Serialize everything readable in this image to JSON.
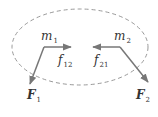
{
  "diagram": {
    "boundary": {
      "style": "dashed ellipse",
      "color": "#999999"
    },
    "bodies": [
      {
        "id": "m1",
        "label": "m",
        "sub": "1"
      },
      {
        "id": "m2",
        "label": "m",
        "sub": "2"
      }
    ],
    "internal_forces": [
      {
        "label": "f",
        "sub": "12",
        "from": "m1",
        "direction": "right"
      },
      {
        "label": "f",
        "sub": "21",
        "from": "m2",
        "direction": "left"
      }
    ],
    "external_forces": [
      {
        "label": "F",
        "sub": "1",
        "from": "m1",
        "direction": "down-left"
      },
      {
        "label": "F",
        "sub": "2",
        "from": "m2",
        "direction": "down-right"
      }
    ],
    "arrow_color": "#777777"
  }
}
